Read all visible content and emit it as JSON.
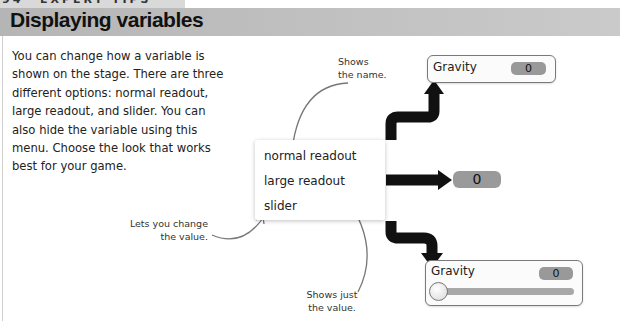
{
  "header": {
    "page_number": "94",
    "kicker": "EXPERT TIPS",
    "title": "Displaying variables"
  },
  "body": {
    "lines": [
      "You can change how a variable is",
      "shown on the stage. There are three",
      "different options: normal readout,",
      "large readout, and slider. You can",
      "also hide the variable using this",
      "menu. Choose the look that works",
      "best for your game."
    ]
  },
  "menu": {
    "items": [
      {
        "label": "normal readout"
      },
      {
        "label": "large readout"
      },
      {
        "label": "slider"
      }
    ]
  },
  "annotations": {
    "shows_name": [
      "Shows",
      "the name."
    ],
    "lets_change": [
      "Lets you change",
      "the value."
    ],
    "shows_value": [
      "Shows just",
      "the value."
    ]
  },
  "readouts": {
    "normal": {
      "label": "Gravity",
      "value": "0"
    },
    "large": {
      "value": "0"
    },
    "slider": {
      "label": "Gravity",
      "value": "0"
    }
  },
  "colors": {
    "title_bar": "#bdbdbd",
    "arrow": "#111111",
    "value_badge": "#999999",
    "annotation_line": "#777777"
  }
}
